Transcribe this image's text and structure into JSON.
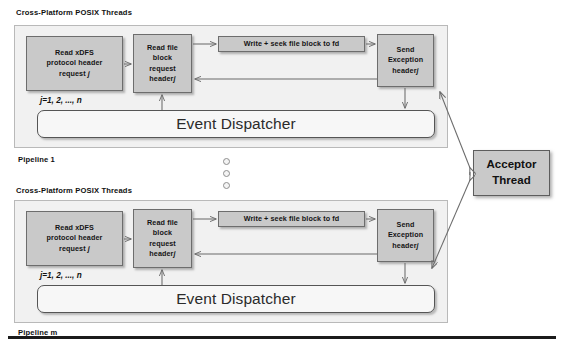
{
  "diagram": {
    "title_top": "Cross-Platform POSIX Threads",
    "title_bottom": "Cross-Platform POSIX Threads",
    "pipeline_top_label": "Pipeline 1",
    "pipeline_bottom_label": "Pipeline m",
    "index_note_top": "j=1, 2, ..., n",
    "index_note_bottom": "j=1, 2, ..., n",
    "ellipsis_dot_count": 3
  },
  "pipeline_top": {
    "read_xdfs": {
      "line1": "Read xDFS",
      "line2": "protocol header",
      "line3": "request",
      "index": "j"
    },
    "read_file_block": {
      "line1": "Read file",
      "line2": "block",
      "line3": "request",
      "line4": "header",
      "index": "j"
    },
    "write_seek": {
      "label": "Write + seek file block to fd"
    },
    "send_exception": {
      "line1": "Send",
      "line2": "Exception",
      "line3": "header",
      "index": "j"
    },
    "dispatcher": {
      "label": "Event Dispatcher"
    }
  },
  "pipeline_bottom": {
    "read_xdfs": {
      "line1": "Read xDFS",
      "line2": "protocol header",
      "line3": "request",
      "index": "j"
    },
    "read_file_block": {
      "line1": "Read file",
      "line2": "block",
      "line3": "request",
      "line4": "header",
      "index": "j"
    },
    "write_seek": {
      "label": "Write + seek file block to fd"
    },
    "send_exception": {
      "line1": "Send",
      "line2": "Exception",
      "line3": "header",
      "index": "j"
    },
    "dispatcher": {
      "label": "Event Dispatcher"
    }
  },
  "acceptor": {
    "line1": "Acceptor",
    "line2": "Thread"
  },
  "colors": {
    "box_fill": "#c9c9c9",
    "box_border": "#6d6d6d",
    "pipeline_fill": "#f1f1f1",
    "pipeline_border": "#b9b9b9",
    "dispatcher_fill": "#f7f7f7",
    "arrow": "#6b6b6b",
    "rule": "#1b1b1b",
    "text": "#111111"
  }
}
